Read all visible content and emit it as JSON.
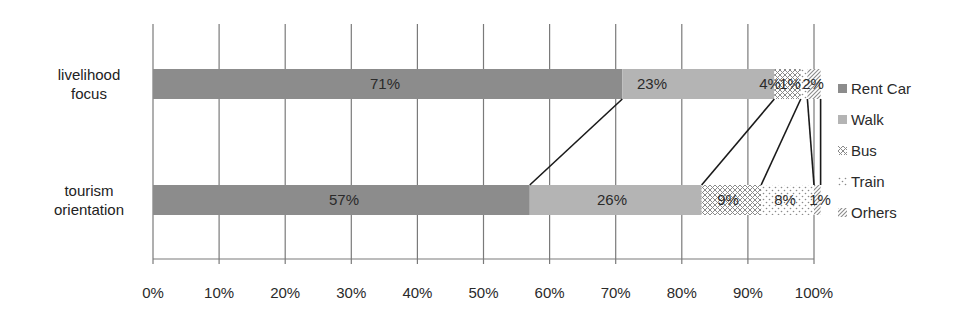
{
  "chart_data": {
    "type": "bar",
    "orientation": "horizontal",
    "stacked": "100%",
    "title": "",
    "xlabel": "",
    "ylabel": "",
    "categories": [
      "livelihood focus",
      "tourism orientation"
    ],
    "series": [
      {
        "name": "Rent Car",
        "values": [
          71,
          57
        ],
        "labels": [
          "71%",
          "57%"
        ],
        "color": "#8c8c8c",
        "pattern": "solid"
      },
      {
        "name": "Walk",
        "values": [
          23,
          26
        ],
        "labels": [
          "23%",
          "26%"
        ],
        "color": "#b4b4b4",
        "pattern": "solid"
      },
      {
        "name": "Bus",
        "values": [
          4,
          9
        ],
        "labels": [
          "4%",
          "9%"
        ],
        "color": "#9a9a9a",
        "pattern": "crosshatch"
      },
      {
        "name": "Train",
        "values": [
          1,
          8
        ],
        "labels": [
          "1%",
          "8%"
        ],
        "color": "#9a9a9a",
        "pattern": "dots"
      },
      {
        "name": "Orhers",
        "values": [
          2,
          1
        ],
        "labels": [
          "2%",
          "1%"
        ],
        "color": "#9a9a9a",
        "pattern": "diagonal"
      }
    ],
    "xlim": [
      0,
      100
    ],
    "xticks": [
      "0%",
      "10%",
      "20%",
      "30%",
      "40%",
      "50%",
      "60%",
      "70%",
      "80%",
      "90%",
      "100%"
    ],
    "grid": true,
    "legend_position": "right",
    "series_lines": true
  },
  "labels": {
    "cat0_line1": "livelihood",
    "cat0_line2": "focus",
    "cat1_line1": "tourism",
    "cat1_line2": "orientation"
  }
}
